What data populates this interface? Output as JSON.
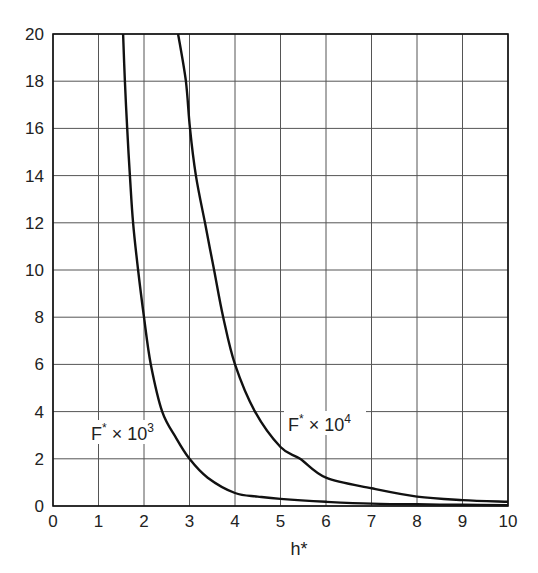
{
  "chart_data": {
    "type": "line",
    "title": "",
    "xlabel": "h*",
    "ylabel": "",
    "xlim": [
      0,
      10
    ],
    "ylim": [
      0,
      20
    ],
    "grid": true,
    "legend_position": "inline labels",
    "x_ticks": [
      "0",
      "1",
      "2",
      "3",
      "4",
      "5",
      "6",
      "7",
      "8",
      "9",
      "10"
    ],
    "y_ticks": [
      "0",
      "2",
      "4",
      "6",
      "8",
      "10",
      "12",
      "14",
      "16",
      "18",
      "20"
    ],
    "series": [
      {
        "name": "F* × 10^3",
        "label_main": "F",
        "label_star": "*",
        "label_times": " × 10",
        "label_exp": "3",
        "x": [
          1.54,
          1.58,
          1.63,
          1.69,
          1.76,
          1.87,
          2.0,
          2.15,
          2.4,
          2.7,
          3.0,
          3.4,
          4.0,
          4.5,
          5.0,
          6.0,
          7.0,
          8.0,
          9.0,
          10.0
        ],
        "y": [
          20,
          18,
          16,
          14,
          12,
          10,
          8,
          6,
          4,
          2.9,
          2.0,
          1.2,
          0.55,
          0.4,
          0.3,
          0.18,
          0.1,
          0.07,
          0.05,
          0.04
        ]
      },
      {
        "name": "F* × 10^4",
        "label_main": "F",
        "label_star": "*",
        "label_times": " × 10",
        "label_exp": "4",
        "x": [
          2.75,
          2.92,
          3.01,
          3.14,
          3.34,
          3.54,
          3.74,
          4.0,
          4.44,
          5.0,
          5.43,
          6.0,
          7.0,
          8.0,
          9.0,
          10.0
        ],
        "y": [
          20,
          18,
          16,
          14,
          12,
          10,
          8,
          6,
          4,
          2.5,
          2.0,
          1.2,
          0.75,
          0.4,
          0.25,
          0.18
        ]
      }
    ]
  }
}
